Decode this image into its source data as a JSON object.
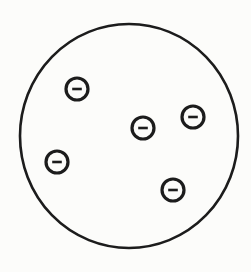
{
  "diagram": {
    "type": "charged-circle-diagram",
    "background_color": "#fcfcfa",
    "stroke_color": "#1c1c1c",
    "width": 251,
    "height": 272,
    "boundary": {
      "cx": 129,
      "cy": 136,
      "rx": 109,
      "ry": 112,
      "stroke_width": 2.6
    },
    "charge": {
      "symbol": "-",
      "count": 5,
      "radius": 11,
      "stroke_width": 3.2,
      "minus_half_length": 4.8,
      "minus_stroke_width": 2.6
    },
    "charges": [
      {
        "cx": 77,
        "cy": 89
      },
      {
        "cx": 193,
        "cy": 117
      },
      {
        "cx": 143,
        "cy": 128
      },
      {
        "cx": 57,
        "cy": 162
      },
      {
        "cx": 173,
        "cy": 190
      }
    ]
  }
}
